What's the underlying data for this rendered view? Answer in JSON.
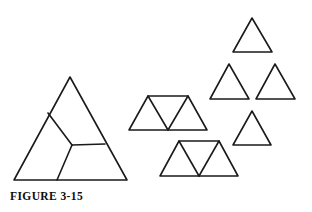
{
  "figure": {
    "caption": "FIGURE 3-15",
    "stroke_color": "#1a1a1a",
    "background_color": "#ffffff",
    "stroke_width": 1.6,
    "canvas": {
      "width": 312,
      "height": 212
    },
    "shapes": [
      {
        "name": "large-subdivided-triangle",
        "kind": "triangle-pinwheel",
        "outline": "70,77 127,180 14,180",
        "interior_lines": [
          "48,113 72,145",
          "72,145 105,144",
          "72,145 57,180"
        ]
      },
      {
        "name": "upper-trapezoid",
        "kind": "trapezoid-three-triangles",
        "outline": "148,96 188,96 207,130 129,130",
        "interior_lines": [
          "148,96 168,130",
          "188,96 168,130"
        ]
      },
      {
        "name": "lower-trapezoid",
        "kind": "trapezoid-three-triangles",
        "outline": "179,141 219,141 238,176 160,176",
        "interior_lines": [
          "179,141 199,176",
          "219,141 199,176"
        ]
      },
      {
        "name": "small-triangle-top",
        "kind": "triangle",
        "outline": "252,18 272,52 233,52",
        "interior_lines": []
      },
      {
        "name": "small-triangle-middle-left",
        "kind": "triangle",
        "outline": "229,64 249,99 210,99",
        "interior_lines": []
      },
      {
        "name": "small-triangle-middle-right",
        "kind": "triangle",
        "outline": "275,64 295,99 256,99",
        "interior_lines": []
      },
      {
        "name": "small-triangle-bottom",
        "kind": "triangle",
        "outline": "252,111 271,145 233,145",
        "interior_lines": []
      }
    ]
  }
}
